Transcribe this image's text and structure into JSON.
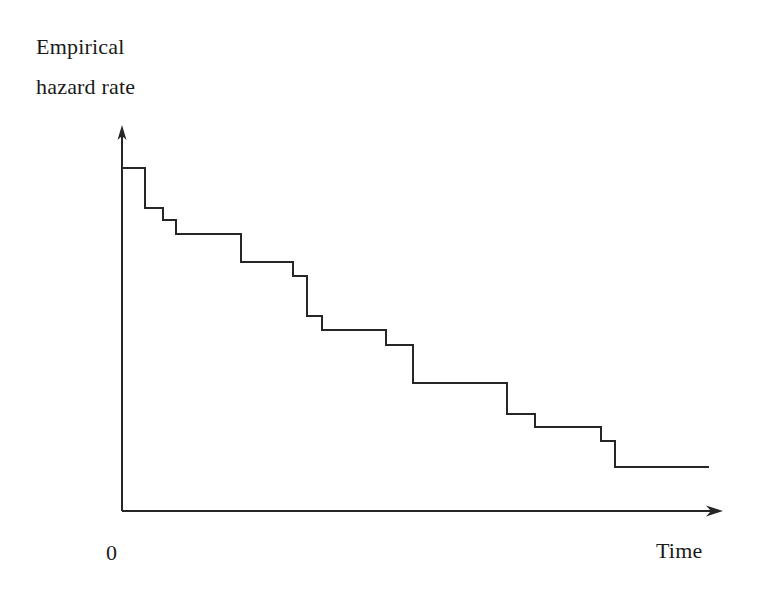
{
  "figure": {
    "background_color": "#ffffff",
    "line_color": "#262626",
    "line_width": 2,
    "width": 757,
    "height": 604
  },
  "labels": {
    "y_axis_line1": "Empirical",
    "y_axis_line2": "hazard rate",
    "origin": "0",
    "x_axis": "Time"
  },
  "axes": {
    "origin_px": [
      122,
      511
    ],
    "y_axis_top_px": [
      122,
      126
    ],
    "x_axis_end_px": [
      722,
      511
    ],
    "y_arrow": "up-arrow",
    "x_arrow": "right-arrow"
  },
  "chart_data": {
    "type": "line",
    "subtype": "step-function",
    "title": "",
    "subtitle": "",
    "xlabel": "Time",
    "ylabel": "Empirical hazard rate",
    "grid": false,
    "legend": null,
    "xlim": [
      0,
      1
    ],
    "ylim": [
      0,
      1
    ],
    "x_tick_labels": [
      "0"
    ],
    "y_tick_labels": [],
    "annotations": [],
    "series": [
      {
        "name": "Empirical hazard rate",
        "step_mode": "post",
        "x": [
          0.0,
          0.038,
          0.068,
          0.09,
          0.198,
          0.285,
          0.308,
          0.333,
          0.44,
          0.485,
          0.642,
          0.688,
          0.798,
          0.82,
          0.977
        ],
        "y": [
          0.892,
          0.788,
          0.757,
          0.72,
          0.72,
          0.647,
          0.611,
          0.507,
          0.47,
          0.431,
          0.332,
          0.252,
          0.218,
          0.182,
          0.114
        ],
        "steps_px": [
          {
            "x0": 122,
            "x1": 145,
            "y": 168
          },
          {
            "x0": 145,
            "x1": 163,
            "y": 208
          },
          {
            "x0": 163,
            "x1": 176,
            "y": 220
          },
          {
            "x0": 176,
            "x1": 241,
            "y": 234
          },
          {
            "x0": 241,
            "x1": 293,
            "y": 262
          },
          {
            "x0": 293,
            "x1": 307,
            "y": 276
          },
          {
            "x0": 307,
            "x1": 322,
            "y": 316
          },
          {
            "x0": 322,
            "x1": 386,
            "y": 330
          },
          {
            "x0": 386,
            "x1": 413,
            "y": 345
          },
          {
            "x0": 413,
            "x1": 507,
            "y": 383
          },
          {
            "x0": 507,
            "x1": 535,
            "y": 414
          },
          {
            "x0": 535,
            "x1": 601,
            "y": 427
          },
          {
            "x0": 601,
            "x1": 615,
            "y": 441
          },
          {
            "x0": 615,
            "x1": 709,
            "y": 467
          }
        ]
      }
    ]
  }
}
